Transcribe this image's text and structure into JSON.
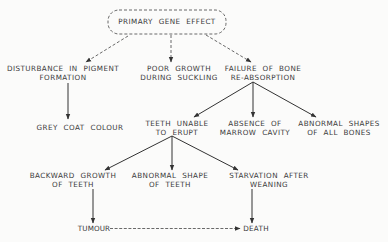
{
  "diagram": {
    "type": "flowchart",
    "colors": {
      "background": "#fbfbfa",
      "line": "#333333",
      "text": "#3a3a3a"
    },
    "root": {
      "id": "primary",
      "lines": [
        "PRIMARY GENE EFFECT"
      ],
      "style": "dashed-rounded-box"
    },
    "nodes": {
      "pigment": {
        "lines": [
          "DISTURBANCE IN PIGMENT",
          "FORMATION"
        ]
      },
      "poor_growth": {
        "lines": [
          "POOR GROWTH",
          "DURING SUCKLING"
        ]
      },
      "bone_failure": {
        "lines": [
          "FAILURE OF BONE",
          "RE-ABSORPTION"
        ]
      },
      "grey_coat": {
        "lines": [
          "GREY COAT COLOUR"
        ]
      },
      "teeth_unable": {
        "lines": [
          "TEETH UNABLE",
          "TO ERUPT"
        ]
      },
      "marrow": {
        "lines": [
          "ABSENCE OF",
          "MARROW CAVITY"
        ]
      },
      "bone_shapes": {
        "lines": [
          "ABNORMAL SHAPES",
          "OF ALL BONES"
        ]
      },
      "backward_growth": {
        "lines": [
          "BACKWARD GROWTH",
          "OF TEETH"
        ]
      },
      "teeth_shape": {
        "lines": [
          "ABNORMAL SHAPE",
          "OF TEETH"
        ]
      },
      "starvation": {
        "lines": [
          "STARVATION AFTER",
          "WEANING"
        ]
      },
      "tumour": {
        "lines": [
          "TUMOUR"
        ]
      },
      "death": {
        "lines": [
          "DEATH"
        ]
      }
    },
    "edges": [
      {
        "from": "primary",
        "to": "pigment",
        "style": "dashed"
      },
      {
        "from": "primary",
        "to": "poor_growth",
        "style": "dashed"
      },
      {
        "from": "primary",
        "to": "bone_failure",
        "style": "dashed"
      },
      {
        "from": "pigment",
        "to": "grey_coat",
        "style": "solid"
      },
      {
        "from": "bone_failure",
        "to": "teeth_unable",
        "style": "solid"
      },
      {
        "from": "bone_failure",
        "to": "marrow",
        "style": "solid"
      },
      {
        "from": "bone_failure",
        "to": "bone_shapes",
        "style": "solid"
      },
      {
        "from": "teeth_unable",
        "to": "backward_growth",
        "style": "solid"
      },
      {
        "from": "teeth_unable",
        "to": "teeth_shape",
        "style": "solid"
      },
      {
        "from": "teeth_unable",
        "to": "starvation",
        "style": "solid"
      },
      {
        "from": "backward_growth",
        "to": "tumour",
        "style": "solid"
      },
      {
        "from": "starvation",
        "to": "death",
        "style": "solid"
      },
      {
        "from": "tumour",
        "to": "death",
        "style": "dashed"
      }
    ]
  }
}
